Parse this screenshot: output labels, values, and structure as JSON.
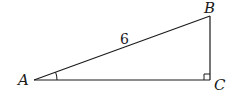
{
  "diagram": {
    "type": "right-triangle",
    "vertices": {
      "A": {
        "label": "A",
        "x": 34,
        "y": 80
      },
      "B": {
        "label": "B",
        "x": 210,
        "y": 16
      },
      "C": {
        "label": "C",
        "x": 210,
        "y": 80
      }
    },
    "sides": {
      "AB": {
        "label": "6"
      }
    },
    "marks": {
      "angle_at": "A",
      "right_angle_at": "C"
    },
    "colors": {
      "stroke": "#1a1a1a",
      "background": "#ffffff"
    }
  }
}
